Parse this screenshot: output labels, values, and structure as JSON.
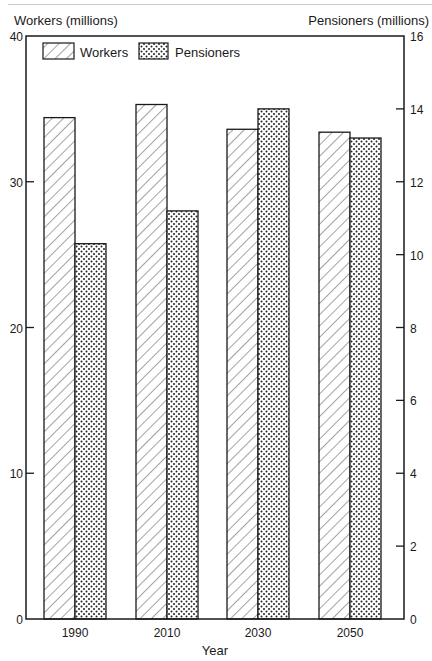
{
  "chart_data": {
    "type": "bar",
    "title": "",
    "xlabel": "Year",
    "ylabel": "Workers (millions)",
    "ylabel_right": "Pensioners (millions)",
    "categories": [
      "1990",
      "2010",
      "2030",
      "2050"
    ],
    "series": [
      {
        "name": "Workers",
        "axis": "left",
        "pattern": "diagonal-hatch",
        "values": [
          34.4,
          35.3,
          33.6,
          33.4
        ]
      },
      {
        "name": "Pensioners",
        "axis": "right",
        "pattern": "dots",
        "values": [
          10.3,
          11.2,
          14.0,
          13.2
        ]
      }
    ],
    "ylim": [
      0,
      40
    ],
    "ylim_right": [
      0,
      16
    ],
    "yticks": [
      0,
      10,
      20,
      30,
      40
    ],
    "yticks_right": [
      0,
      2,
      4,
      6,
      8,
      10,
      12,
      14,
      16
    ],
    "grid": false,
    "legend_position": "top-left inside"
  },
  "labels": {
    "left_axis_title": "Workers (millions)",
    "right_axis_title": "Pensioners (millions)",
    "x_axis_title": "Year",
    "legend_workers": "Workers",
    "legend_pensioners": "Pensioners",
    "left_ticks": [
      "0",
      "10",
      "20",
      "30",
      "40"
    ],
    "right_ticks": [
      "0",
      "2",
      "4",
      "6",
      "8",
      "10",
      "12",
      "14",
      "16"
    ],
    "categories": [
      "1990",
      "2010",
      "2030",
      "2050"
    ]
  }
}
